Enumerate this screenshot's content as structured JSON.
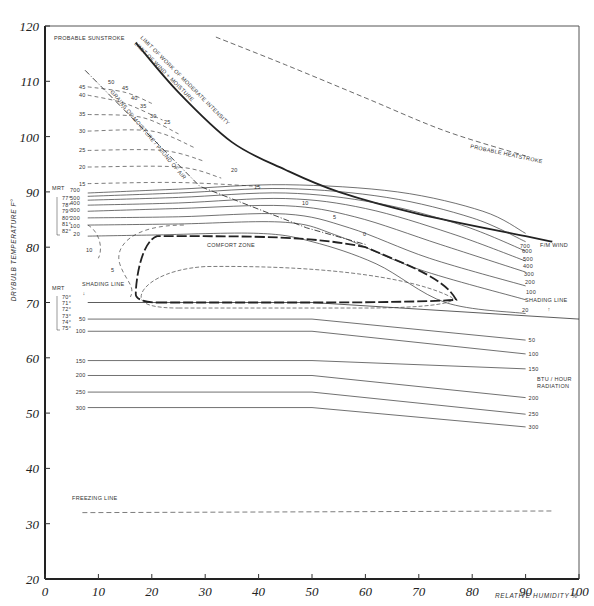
{
  "chart_data": {
    "type": "line",
    "xlabel": "RELATIVE HUMIDITY %",
    "ylabel": "DRYBULB TEMPERATURE F°",
    "xlim": [
      0,
      100
    ],
    "ylim": [
      20,
      120
    ],
    "x_ticks": [
      0,
      10,
      20,
      30,
      40,
      50,
      60,
      70,
      80,
      90,
      100
    ],
    "y_ticks": [
      20,
      30,
      40,
      50,
      60,
      70,
      80,
      90,
      100,
      110,
      120
    ],
    "grid": false,
    "annotations": {
      "probable_sunstroke": "PROBABLE SUNSTROKE",
      "probable_heatstroke": "PROBABLE HEATSTROKE",
      "limit_work": "LIMIT OF WORK OF MODERATE INTENSITY",
      "limit_wind": "LIMIT OF WIND + MOISTURE",
      "grains": "GRAINS OF MOISTURE / POUND OF AIR",
      "comfort_zone": "COMFORT ZONE",
      "shading_line": "SHADING LINE",
      "freezing_line": "FREEZING LINE",
      "wind_unit": "F/M WIND",
      "radiation_unit_1": "BTU / HOUR",
      "radiation_unit_2": "RADIATION",
      "mrt": "MRT"
    },
    "mrt_upper": [
      "77°",
      "78°",
      "79°",
      "80°",
      "81°",
      "82°"
    ],
    "mrt_lower": [
      "70°",
      "71°",
      "72°",
      "73°",
      "74°",
      "75°"
    ],
    "grains_left_labels": [
      "45",
      "40",
      "35",
      "30",
      "25",
      "20",
      "15"
    ],
    "grains_diag_labels": [
      "50",
      "45",
      "40",
      "35",
      "30",
      "25",
      "20",
      "15",
      "10",
      "5",
      "0"
    ],
    "wind_labels_left": [
      "700",
      "500",
      "400",
      "300",
      "200",
      "100",
      "20"
    ],
    "wind_labels_right": [
      "700",
      "600",
      "500",
      "400",
      "300",
      "200",
      "100",
      "20"
    ],
    "wind_series": [
      {
        "name": "20",
        "points": [
          [
            8,
            82
          ],
          [
            20,
            82.2
          ],
          [
            40,
            82.5
          ],
          [
            50,
            81
          ],
          [
            62,
            77
          ],
          [
            75,
            70
          ],
          [
            90,
            68
          ]
        ]
      },
      {
        "name": "100",
        "points": [
          [
            8,
            84
          ],
          [
            25,
            84.2
          ],
          [
            45,
            84.5
          ],
          [
            55,
            82
          ],
          [
            70,
            76
          ],
          [
            90,
            70.5
          ]
        ]
      },
      {
        "name": "200",
        "points": [
          [
            8,
            85.3
          ],
          [
            25,
            85.5
          ],
          [
            45,
            86
          ],
          [
            57,
            83.5
          ],
          [
            72,
            78
          ],
          [
            90,
            73
          ]
        ]
      },
      {
        "name": "300",
        "points": [
          [
            8,
            86.5
          ],
          [
            25,
            87
          ],
          [
            45,
            87.5
          ],
          [
            58,
            85.5
          ],
          [
            74,
            80.5
          ],
          [
            90,
            75.5
          ]
        ]
      },
      {
        "name": "400",
        "points": [
          [
            8,
            87.6
          ],
          [
            25,
            88
          ],
          [
            45,
            88.8
          ],
          [
            60,
            87
          ],
          [
            76,
            82.5
          ],
          [
            90,
            77.5
          ]
        ]
      },
      {
        "name": "500",
        "points": [
          [
            8,
            88.5
          ],
          [
            25,
            89
          ],
          [
            45,
            89.8
          ],
          [
            62,
            88
          ],
          [
            78,
            84
          ],
          [
            90,
            79.3
          ]
        ]
      },
      {
        "name": "600",
        "points": [
          [
            8,
            89.2
          ],
          [
            25,
            89.8
          ],
          [
            45,
            90.6
          ],
          [
            64,
            89
          ],
          [
            80,
            85.3
          ],
          [
            90,
            81
          ]
        ]
      },
      {
        "name": "700",
        "points": [
          [
            8,
            89.8
          ],
          [
            25,
            90.5
          ],
          [
            45,
            91.3
          ],
          [
            66,
            90
          ],
          [
            82,
            86.5
          ],
          [
            90,
            82.5
          ]
        ]
      }
    ],
    "radiation_series": [
      {
        "name": "50",
        "points": [
          [
            8,
            67
          ],
          [
            50,
            67
          ],
          [
            90,
            63.2
          ]
        ]
      },
      {
        "name": "100",
        "points": [
          [
            8,
            64.8
          ],
          [
            50,
            64.8
          ],
          [
            90,
            60.7
          ]
        ]
      },
      {
        "name": "150",
        "points": [
          [
            8,
            59.5
          ],
          [
            50,
            59.5
          ],
          [
            90,
            58
          ]
        ]
      },
      {
        "name": "200",
        "points": [
          [
            8,
            56.8
          ],
          [
            50,
            56.8
          ],
          [
            90,
            52.8
          ]
        ]
      },
      {
        "name": "250",
        "points": [
          [
            8,
            53.8
          ],
          [
            50,
            53.8
          ],
          [
            90,
            49.8
          ]
        ]
      },
      {
        "name": "300",
        "points": [
          [
            8,
            51
          ],
          [
            50,
            51
          ],
          [
            90,
            47.5
          ]
        ]
      }
    ],
    "radiation_labels": [
      "50",
      "100",
      "150",
      "200",
      "250",
      "300"
    ],
    "grains_curves": [
      {
        "name": "45",
        "points": [
          [
            8,
            109
          ],
          [
            15,
            108
          ],
          [
            20,
            106
          ]
        ]
      },
      {
        "name": "40",
        "points": [
          [
            8,
            107.5
          ],
          [
            15,
            106
          ],
          [
            22,
            103
          ]
        ]
      },
      {
        "name": "35",
        "points": [
          [
            8,
            104
          ],
          [
            18,
            103.5
          ],
          [
            25,
            100.5
          ]
        ]
      },
      {
        "name": "30",
        "points": [
          [
            8,
            101
          ],
          [
            20,
            101
          ],
          [
            28,
            98
          ]
        ]
      },
      {
        "name": "25",
        "points": [
          [
            8,
            97.5
          ],
          [
            22,
            97.5
          ],
          [
            30,
            95.5
          ]
        ]
      },
      {
        "name": "20",
        "points": [
          [
            8,
            94.5
          ],
          [
            25,
            94.5
          ],
          [
            33,
            92.5
          ]
        ]
      },
      {
        "name": "15",
        "points": [
          [
            8,
            91.5
          ],
          [
            25,
            91.7
          ],
          [
            40,
            91
          ]
        ]
      }
    ],
    "limit_work_curve": [
      [
        17,
        117
      ],
      [
        25,
        108
      ],
      [
        35,
        99
      ],
      [
        45,
        94
      ],
      [
        55,
        90
      ],
      [
        70,
        86
      ],
      [
        90,
        82
      ],
      [
        95,
        81
      ]
    ],
    "heatstroke_curve": [
      [
        32,
        118
      ],
      [
        45,
        113
      ],
      [
        60,
        107
      ],
      [
        75,
        101
      ],
      [
        90,
        96.5
      ]
    ],
    "freezing_temp": 32,
    "shading_temp": 70,
    "comfort_zone": {
      "lower_temp": 70,
      "upper_temp": 82,
      "rh_range": [
        20,
        77
      ]
    }
  }
}
